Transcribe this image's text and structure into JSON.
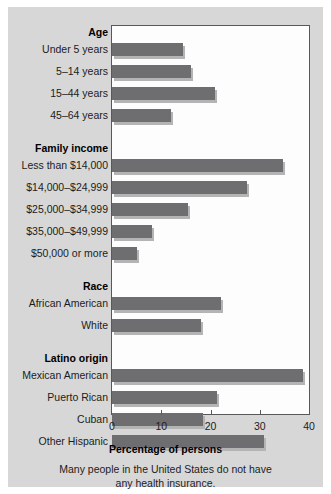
{
  "figure": {
    "axis_title": "Percentage of persons",
    "caption_line1": "Many people in the United States do not have",
    "caption_line2": "any health insurance.",
    "bar_color": "#6e6e70",
    "panel_color": "#d7d7d7",
    "plot_background": "#fdfdfd"
  },
  "chart_data": {
    "type": "bar",
    "orientation": "horizontal",
    "title": "",
    "xlabel": "Percentage of persons",
    "ylabel": "",
    "xlim": [
      0,
      40
    ],
    "xticks": [
      0,
      10,
      20,
      30,
      40
    ],
    "xticklabels": [
      "0",
      "10",
      "20",
      "30",
      "40"
    ],
    "grid": false,
    "legend": false,
    "groups": [
      {
        "heading": "Age",
        "categories": [
          "Under 5 years",
          "5–14 years",
          "15–44 years",
          "45–64 years"
        ],
        "values": [
          14.5,
          16,
          21,
          12
        ]
      },
      {
        "heading": "Family income",
        "categories": [
          "Less than $14,000",
          "$14,000–$24,999",
          "$25,000–$34,999",
          "$35,000–$49,999",
          "$50,000 or more"
        ],
        "values": [
          34.8,
          27.5,
          15.4,
          8.2,
          5
        ]
      },
      {
        "heading": "Race",
        "categories": [
          "African American",
          "White"
        ],
        "values": [
          22.2,
          18
        ]
      },
      {
        "heading": "Latino origin",
        "categories": [
          "Mexican American",
          "Puerto Rican",
          "Cuban",
          "Other Hispanic"
        ],
        "values": [
          38.8,
          21.4,
          18.4,
          30.8
        ]
      }
    ]
  }
}
